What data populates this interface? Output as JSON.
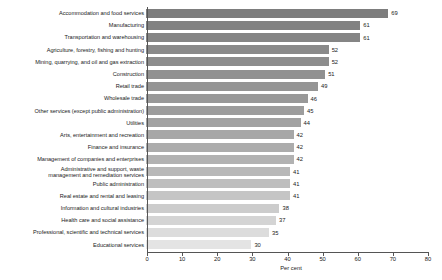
{
  "chart_data": {
    "type": "bar",
    "orientation": "horizontal",
    "title": "",
    "xlabel": "Per cent",
    "ylabel": "",
    "xlim": [
      0,
      80
    ],
    "xticks": [
      0,
      10,
      20,
      30,
      40,
      50,
      60,
      70,
      80
    ],
    "grid": false,
    "legend": null,
    "categories": [
      "Accommodation and food services",
      "Manufacturing",
      "Transportation and warehousing",
      "Agriculture, forestry, fishing and hunting",
      "Mining, quarrying, and oil and gas extraction",
      "Construction",
      "Retail trade",
      "Wholesale trade",
      "Other services (except public administration)",
      "Utilities",
      "Arts, entertainment and recreation",
      "Finance and insurance",
      "Management of companies and enterprises",
      "Administrative and support, waste\nmanagement and remediation services",
      "Public administration",
      "Real estate and rental and leasing",
      "Information and cultural industries",
      "Health care and social assistance",
      "Professional, scientific and technical services",
      "Educational services"
    ],
    "values": [
      69,
      61,
      61,
      52,
      52,
      51,
      49,
      46,
      45,
      44,
      42,
      42,
      42,
      41,
      41,
      41,
      38,
      37,
      35,
      30
    ],
    "bar_colors": [
      "#7d7d7d",
      "#828282",
      "#858585",
      "#8a8a8a",
      "#8d8d8d",
      "#919191",
      "#959595",
      "#999999",
      "#9d9d9d",
      "#a2a2a2",
      "#a7a7a7",
      "#acacac",
      "#b2b2b2",
      "#b8b8b8",
      "#bebebe",
      "#c5c5c5",
      "#cccccc",
      "#d4d4d4",
      "#dcdcdc",
      "#e4e4e4"
    ]
  },
  "colors": {
    "background": "#ffffff",
    "axis": "#555555",
    "text": "#1a1a1a"
  }
}
